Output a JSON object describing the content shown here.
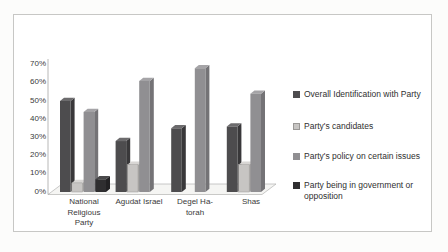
{
  "window": {
    "background": "#fcfcfb",
    "frame_border": "#c7c7c5",
    "frame_background": "#ffffff"
  },
  "chart_data": {
    "type": "bar",
    "effect": "3d-clustered-column",
    "title": "",
    "xlabel": "",
    "ylabel": "",
    "categories": [
      "National Religious Party",
      "Agudat Israel",
      "Degel Ha-torah",
      "Shas"
    ],
    "categories_display": [
      "National\nReligious\nParty",
      "Agudat Israel",
      "Degel Ha-\ntorah",
      "Shas"
    ],
    "series": [
      {
        "name": "Overall Identification with Party",
        "values": [
          50,
          28,
          35,
          36
        ],
        "colors": {
          "front": "#4d4c4e",
          "top": "#6c6b6d",
          "side": "#39383a"
        }
      },
      {
        "name": "Party's candidates",
        "values": [
          5,
          15,
          0,
          15
        ],
        "colors": {
          "front": "#c7c5c3",
          "top": "#d8d6d4",
          "side": "#a9a7a5",
          "stroke": "#9a9896"
        }
      },
      {
        "name": "Party's policy on certain issues",
        "values": [
          44,
          61,
          68,
          54
        ],
        "colors": {
          "front": "#908f92",
          "top": "#a5a4a7",
          "side": "#747376"
        }
      },
      {
        "name": "Party being in government or opposition",
        "values": [
          7,
          0,
          0,
          0
        ],
        "colors": {
          "front": "#2f2e30",
          "top": "#4a494b",
          "side": "#222123"
        }
      }
    ],
    "ylim": [
      0,
      70
    ],
    "ytick_step": 10,
    "yticks": [
      "0%",
      "10%",
      "20%",
      "30%",
      "40%",
      "50%",
      "60%",
      "70%"
    ],
    "grid": false,
    "legend_position": "right",
    "text_color": "#3a3a3a",
    "axis_color": "#a6a6a4",
    "floor_fill": "#f5f5f3",
    "floor_stroke": "#b3b3b1"
  }
}
